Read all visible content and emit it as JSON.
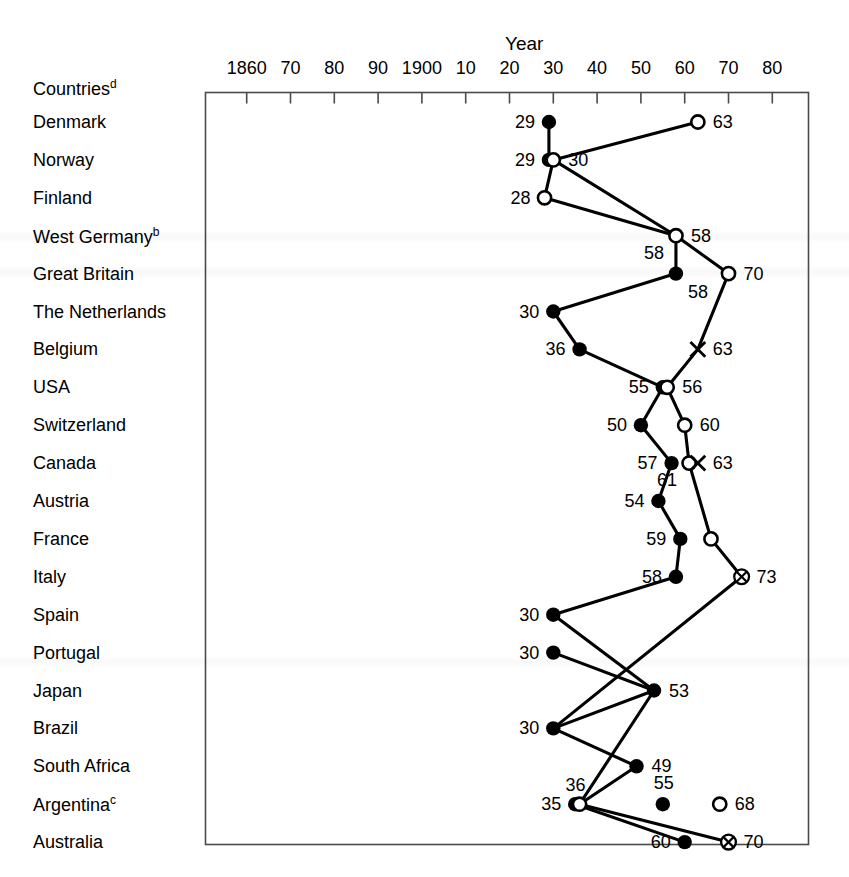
{
  "chart_data": {
    "type": "scatter",
    "title": "Year",
    "xlabel": "Year",
    "ylabel": "Countries",
    "grid": false,
    "legend_position": "none",
    "axis": {
      "tick_labels": [
        "1860",
        "70",
        "80",
        "90",
        "1900",
        "10",
        "20",
        "30",
        "40",
        "50",
        "60",
        "70",
        "80"
      ],
      "tick_years": [
        1860,
        1870,
        1880,
        1890,
        1900,
        1910,
        1920,
        1930,
        1940,
        1950,
        1960,
        1970,
        1980
      ],
      "xlim": [
        1857,
        1984
      ]
    },
    "row_header": {
      "text": "Countries",
      "sup": "d"
    },
    "categories": [
      {
        "label": "Denmark",
        "sup": ""
      },
      {
        "label": "Norway",
        "sup": ""
      },
      {
        "label": "Finland",
        "sup": ""
      },
      {
        "label": "West Germany",
        "sup": "b"
      },
      {
        "label": "Great Britain",
        "sup": ""
      },
      {
        "label": "The Netherlands",
        "sup": ""
      },
      {
        "label": "Belgium",
        "sup": ""
      },
      {
        "label": "USA",
        "sup": ""
      },
      {
        "label": "Switzerland",
        "sup": ""
      },
      {
        "label": "Canada",
        "sup": ""
      },
      {
        "label": "Austria",
        "sup": ""
      },
      {
        "label": "France",
        "sup": ""
      },
      {
        "label": "Italy",
        "sup": ""
      },
      {
        "label": "Spain",
        "sup": ""
      },
      {
        "label": "Portugal",
        "sup": ""
      },
      {
        "label": "Japan",
        "sup": ""
      },
      {
        "label": "Brazil",
        "sup": ""
      },
      {
        "label": "South Africa",
        "sup": ""
      },
      {
        "label": "Argentina",
        "sup": "c"
      },
      {
        "label": "Australia",
        "sup": ""
      }
    ],
    "points": [
      {
        "row": 0,
        "year": 1929,
        "marker": "filled",
        "label": "29",
        "label_side": "left"
      },
      {
        "row": 0,
        "year": 1963,
        "marker": "open",
        "label": "63",
        "label_side": "right"
      },
      {
        "row": 1,
        "year": 1929,
        "marker": "filled",
        "label": "29",
        "label_side": "left"
      },
      {
        "row": 1,
        "year": 1930,
        "marker": "open",
        "label": "30",
        "label_side": "right"
      },
      {
        "row": 2,
        "year": 1928,
        "marker": "open",
        "label": "28",
        "label_side": "left"
      },
      {
        "row": 3,
        "year": 1958,
        "marker": "open",
        "label": "58",
        "label_side": "right"
      },
      {
        "row": 3,
        "year": 1958,
        "marker": "none",
        "label": "58",
        "label_side": "below-left"
      },
      {
        "row": 4,
        "year": 1958,
        "marker": "filled",
        "label": "58",
        "label_side": "below-right"
      },
      {
        "row": 4,
        "year": 1970,
        "marker": "open",
        "label": "70",
        "label_side": "right"
      },
      {
        "row": 5,
        "year": 1930,
        "marker": "filled",
        "label": "30",
        "label_side": "left"
      },
      {
        "row": 6,
        "year": 1936,
        "marker": "filled",
        "label": "36",
        "label_side": "left"
      },
      {
        "row": 6,
        "year": 1963,
        "marker": "cross",
        "label": "63",
        "label_side": "right"
      },
      {
        "row": 7,
        "year": 1955,
        "marker": "filled",
        "label": "55",
        "label_side": "left"
      },
      {
        "row": 7,
        "year": 1956,
        "marker": "open",
        "label": "56",
        "label_side": "right"
      },
      {
        "row": 8,
        "year": 1950,
        "marker": "filled",
        "label": "50",
        "label_side": "left"
      },
      {
        "row": 8,
        "year": 1960,
        "marker": "open",
        "label": "60",
        "label_side": "right"
      },
      {
        "row": 9,
        "year": 1957,
        "marker": "filled",
        "label": "57",
        "label_side": "left"
      },
      {
        "row": 9,
        "year": 1961,
        "marker": "open",
        "label": "61",
        "label_side": "below-left"
      },
      {
        "row": 9,
        "year": 1963,
        "marker": "cross",
        "label": "63",
        "label_side": "right"
      },
      {
        "row": 10,
        "year": 1954,
        "marker": "filled",
        "label": "54",
        "label_side": "left"
      },
      {
        "row": 11,
        "year": 1959,
        "marker": "filled",
        "label": "59",
        "label_side": "left"
      },
      {
        "row": 11,
        "year": 1966,
        "marker": "open",
        "label": "",
        "label_side": "right"
      },
      {
        "row": 12,
        "year": 1958,
        "marker": "filled",
        "label": "58",
        "label_side": "left"
      },
      {
        "row": 12,
        "year": 1973,
        "marker": "circle-cross",
        "label": "73",
        "label_side": "right"
      },
      {
        "row": 13,
        "year": 1930,
        "marker": "filled",
        "label": "30",
        "label_side": "left"
      },
      {
        "row": 14,
        "year": 1930,
        "marker": "filled",
        "label": "30",
        "label_side": "left"
      },
      {
        "row": 15,
        "year": 1953,
        "marker": "filled",
        "label": "53",
        "label_side": "right"
      },
      {
        "row": 16,
        "year": 1930,
        "marker": "filled",
        "label": "30",
        "label_side": "left"
      },
      {
        "row": 17,
        "year": 1949,
        "marker": "filled",
        "label": "49",
        "label_side": "right"
      },
      {
        "row": 18,
        "year": 1935,
        "marker": "filled",
        "label": "35",
        "label_side": "left"
      },
      {
        "row": 18,
        "year": 1936,
        "marker": "open",
        "label": "36",
        "label_side": "above-right"
      },
      {
        "row": 18,
        "year": 1955,
        "marker": "filled",
        "label": "55",
        "label_side": "above"
      },
      {
        "row": 18,
        "year": 1968,
        "marker": "open",
        "label": "68",
        "label_side": "right"
      },
      {
        "row": 19,
        "year": 1960,
        "marker": "filled",
        "label": "60",
        "label_side": "left"
      },
      {
        "row": 19,
        "year": 1970,
        "marker": "circle-cross",
        "label": "70",
        "label_side": "right"
      }
    ],
    "connections": [
      {
        "from": [
          0,
          1929
        ],
        "to": [
          1,
          1929
        ]
      },
      {
        "from": [
          0,
          1963
        ],
        "to": [
          1,
          1930
        ]
      },
      {
        "from": [
          1,
          1930
        ],
        "to": [
          2,
          1928
        ]
      },
      {
        "from": [
          1,
          1930
        ],
        "to": [
          3,
          1958
        ]
      },
      {
        "from": [
          2,
          1928
        ],
        "to": [
          3,
          1958
        ]
      },
      {
        "from": [
          3,
          1958
        ],
        "to": [
          4,
          1958
        ]
      },
      {
        "from": [
          3,
          1958
        ],
        "to": [
          4,
          1970
        ]
      },
      {
        "from": [
          4,
          1958
        ],
        "to": [
          5,
          1930
        ]
      },
      {
        "from": [
          4,
          1970
        ],
        "to": [
          6,
          1963
        ]
      },
      {
        "from": [
          5,
          1930
        ],
        "to": [
          6,
          1936
        ]
      },
      {
        "from": [
          6,
          1936
        ],
        "to": [
          7,
          1955
        ]
      },
      {
        "from": [
          6,
          1963
        ],
        "to": [
          7,
          1956
        ]
      },
      {
        "from": [
          7,
          1955
        ],
        "to": [
          8,
          1950
        ]
      },
      {
        "from": [
          7,
          1956
        ],
        "to": [
          8,
          1960
        ]
      },
      {
        "from": [
          8,
          1950
        ],
        "to": [
          9,
          1957
        ]
      },
      {
        "from": [
          8,
          1960
        ],
        "to": [
          9,
          1961
        ]
      },
      {
        "from": [
          9,
          1957
        ],
        "to": [
          10,
          1954
        ]
      },
      {
        "from": [
          9,
          1961
        ],
        "to": [
          11,
          1966
        ]
      },
      {
        "from": [
          10,
          1954
        ],
        "to": [
          11,
          1959
        ]
      },
      {
        "from": [
          11,
          1959
        ],
        "to": [
          12,
          1958
        ]
      },
      {
        "from": [
          11,
          1966
        ],
        "to": [
          12,
          1973
        ]
      },
      {
        "from": [
          12,
          1958
        ],
        "to": [
          13,
          1930
        ]
      },
      {
        "from": [
          12,
          1973
        ],
        "to": [
          16,
          1930
        ]
      },
      {
        "from": [
          13,
          1930
        ],
        "to": [
          15,
          1953
        ]
      },
      {
        "from": [
          14,
          1930
        ],
        "to": [
          15,
          1953
        ]
      },
      {
        "from": [
          15,
          1953
        ],
        "to": [
          16,
          1930
        ]
      },
      {
        "from": [
          15,
          1953
        ],
        "to": [
          18,
          1936
        ]
      },
      {
        "from": [
          16,
          1930
        ],
        "to": [
          17,
          1949
        ]
      },
      {
        "from": [
          17,
          1949
        ],
        "to": [
          18,
          1936
        ]
      },
      {
        "from": [
          18,
          1935
        ],
        "to": [
          19,
          1960
        ]
      },
      {
        "from": [
          18,
          1936
        ],
        "to": [
          19,
          1970
        ]
      }
    ]
  }
}
